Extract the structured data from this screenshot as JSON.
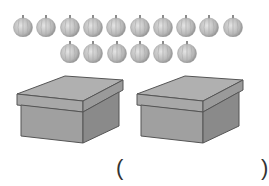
{
  "objects": {
    "row1_count": 10,
    "row2_count": 6,
    "box_count": 2
  },
  "answer": {
    "open_paren": "(",
    "close_paren": ")",
    "value": ""
  },
  "colors": {
    "ball_fill": "#b8b8b8",
    "box_top": "#b0b0b0",
    "box_front": "#a0a0a0",
    "box_side": "#8a8a8a",
    "outline": "#555555"
  }
}
